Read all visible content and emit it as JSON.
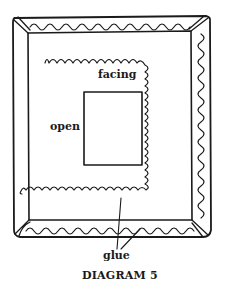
{
  "diagram": {
    "title": "DIAGRAM 5",
    "labels": {
      "facing": "facing",
      "open": "open",
      "glue": "glue"
    },
    "colors": {
      "line": "#1a1a1a",
      "background": "#ffffff"
    }
  }
}
